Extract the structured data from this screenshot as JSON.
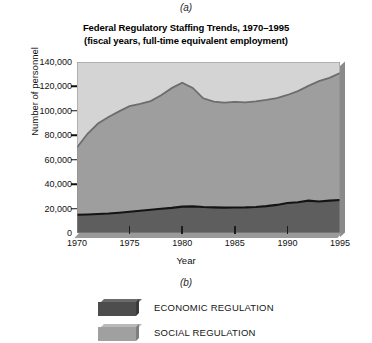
{
  "panel_labels": {
    "top": "(a)",
    "bottom": "(b)"
  },
  "chart_data": {
    "type": "area",
    "stacked": true,
    "title": "Federal Regulatory Staffing Trends, 1970–1995",
    "subtitle": "(fiscal years, full-time equivalent employment)",
    "title_line1": "Federal Regulatory Staffing Trends, 1970–1995",
    "title_line2": "(fiscal years, full-time equivalent employment)",
    "xlabel": "Year",
    "ylabel": "Number of personnel",
    "xlim": [
      1970,
      1995
    ],
    "ylim": [
      0,
      140000
    ],
    "grid": false,
    "legend_position": "below-plot",
    "x_tick_labels": [
      "1970",
      "1975",
      "1980",
      "1985",
      "1990",
      "1995"
    ],
    "x_ticks": [
      1970,
      1975,
      1980,
      1985,
      1990,
      1995
    ],
    "y_tick_labels": [
      "0",
      "20,000",
      "40,000",
      "60,000",
      "80,000",
      "100,000",
      "120,000",
      "140,000"
    ],
    "y_ticks": [
      0,
      20000,
      40000,
      60000,
      80000,
      100000,
      120000,
      140000
    ],
    "x": [
      1970,
      1971,
      1972,
      1973,
      1974,
      1975,
      1976,
      1977,
      1978,
      1979,
      1980,
      1981,
      1982,
      1983,
      1984,
      1985,
      1986,
      1987,
      1988,
      1989,
      1990,
      1991,
      1992,
      1993,
      1994,
      1995
    ],
    "series": [
      {
        "name": "ECONOMIC REGULATION",
        "color": "#5a5a5a",
        "values": [
          15000,
          15200,
          15600,
          16000,
          16600,
          17400,
          18200,
          19000,
          19800,
          20600,
          21600,
          21800,
          21300,
          21000,
          20800,
          20900,
          21000,
          21300,
          22000,
          23000,
          24500,
          25200,
          26500,
          25800,
          26500,
          27000
        ]
      },
      {
        "name": "SOCIAL REGULATION",
        "color": "#9d9d9d",
        "values": [
          55000,
          66000,
          74000,
          79000,
          83000,
          86500,
          87500,
          89000,
          93000,
          98000,
          101500,
          97000,
          89000,
          86500,
          86000,
          86500,
          86000,
          86500,
          87000,
          87500,
          88500,
          91000,
          94000,
          98500,
          100500,
          104000
        ]
      }
    ],
    "totals": [
      70000,
      81200,
      89600,
      95000,
      99600,
      103900,
      105700,
      108000,
      112800,
      118600,
      123100,
      118800,
      110300,
      107500,
      106800,
      107400,
      107000,
      107800,
      109000,
      110500,
      113000,
      116200,
      120500,
      124300,
      127000,
      131000
    ],
    "annotations": []
  },
  "legend": {
    "items": [
      {
        "label": "ECONOMIC REGULATION",
        "color": "#4d4d4d",
        "top_color": "#6b6b6b",
        "side_color": "#3a3a3a"
      },
      {
        "label": "SOCIAL REGULATION",
        "color": "#a0a0a0",
        "top_color": "#b9b9b9",
        "side_color": "#7e7e7e"
      }
    ]
  },
  "colors": {
    "economic_fill": "#5e5e5e",
    "social_fill": "#9e9e9e",
    "plot_background": "#d2d2d2",
    "axis": "#111111",
    "boundary_line_dark": "#1c1c1c",
    "boundary_line_mid": "#6a6a6a"
  }
}
